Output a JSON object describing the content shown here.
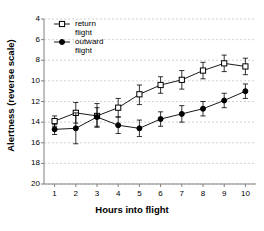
{
  "chart_data": {
    "type": "line",
    "title": "",
    "xlabel": "Hours into flight",
    "ylabel": "Alertness (reverse scale)",
    "x": [
      1,
      2,
      3,
      4,
      5,
      6,
      7,
      8,
      9,
      10
    ],
    "xlim": [
      0.5,
      10.5
    ],
    "ylim": [
      4,
      20
    ],
    "y_reversed": true,
    "grid": true,
    "grid_axis": "y",
    "legend_position": "top-left",
    "xticks": [
      "1",
      "2",
      "3",
      "4",
      "5",
      "6",
      "7",
      "8",
      "9",
      "10"
    ],
    "yticks": [
      "4",
      "6",
      "8",
      "10",
      "12",
      "14",
      "16",
      "18",
      "20"
    ],
    "series": [
      {
        "name": "return flight",
        "marker": "open-square",
        "values": [
          13.9,
          13.1,
          13.4,
          12.6,
          11.3,
          10.4,
          9.9,
          9.0,
          8.3,
          8.6
        ],
        "err_low": [
          13.4,
          12.1,
          12.2,
          11.7,
          10.4,
          9.6,
          9.0,
          8.2,
          7.5,
          7.8
        ],
        "err_high": [
          14.4,
          14.1,
          14.5,
          13.5,
          12.3,
          11.2,
          10.8,
          9.8,
          9.1,
          9.4
        ]
      },
      {
        "name": "outward flight",
        "marker": "filled-diamond",
        "values": [
          14.7,
          14.6,
          13.5,
          14.3,
          14.6,
          13.7,
          13.2,
          12.7,
          11.9,
          11.0
        ],
        "err_low": [
          14.2,
          13.1,
          12.6,
          13.5,
          13.8,
          13.0,
          12.4,
          12.0,
          11.2,
          10.3
        ],
        "err_high": [
          15.2,
          16.1,
          14.4,
          15.1,
          15.4,
          14.4,
          14.0,
          13.4,
          12.6,
          11.7
        ]
      }
    ]
  },
  "legend": {
    "items": [
      {
        "line1": "return",
        "line2": "flight"
      },
      {
        "line1": "outward",
        "line2": "flight"
      }
    ]
  },
  "colors": {
    "axis": "#808080",
    "grid": "#c8c8c8",
    "series": "#000000",
    "background": "#ffffff"
  }
}
